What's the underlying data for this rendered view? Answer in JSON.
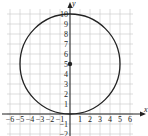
{
  "chart_data": {
    "type": "scatter",
    "title": "",
    "xlabel": "x",
    "ylabel": "y",
    "xlim": [
      -6,
      6
    ],
    "ylim": [
      -2,
      10
    ],
    "grid": true,
    "x_ticks": [
      "-6",
      "-5",
      "-4",
      "-3",
      "-2",
      "-1",
      "1",
      "2",
      "3",
      "4",
      "5",
      "6"
    ],
    "y_ticks": [
      "-2",
      "-1",
      "1",
      "2",
      "3",
      "4",
      "5",
      "6",
      "7",
      "8",
      "9",
      "10"
    ],
    "shapes": [
      {
        "kind": "circle",
        "center": [
          0,
          5
        ],
        "radius": 5,
        "equation": "x^2 + (y-5)^2 = 25"
      }
    ],
    "points": [
      {
        "x": 0,
        "y": 5,
        "label": "center"
      }
    ],
    "colors": {
      "curve": "#222222",
      "grid": "#c8c8c8",
      "axis": "#222222"
    }
  }
}
